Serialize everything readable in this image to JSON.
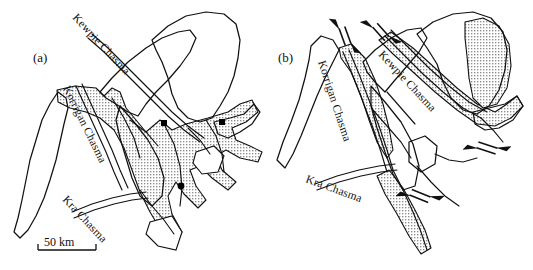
{
  "figure": {
    "type": "geologic-sketch-map",
    "panel_count": 2,
    "background_color": "#ffffff",
    "line_color": "#111111",
    "stipple_color": "#8a8a8a",
    "marker_color": "#000000"
  },
  "panels": [
    {
      "id": "a",
      "tag": "(a)",
      "tag_x": 33,
      "tag_y": 62,
      "labels": [
        {
          "name": "kewpie-chasma-label",
          "text": "Kewpie Chasma",
          "x": 72,
          "y": 18,
          "rotate": 47
        },
        {
          "name": "korrigan-chasma-label",
          "text": "Korrigan Chasma",
          "x": 63,
          "y": 88,
          "rotate": 64
        },
        {
          "name": "kra-chasma-label",
          "text": "Kra Chasma",
          "x": 62,
          "y": 200,
          "rotate": 47
        }
      ],
      "markers": [
        {
          "name": "site-marker-1",
          "x": 164,
          "y": 123,
          "size": 5.5
        },
        {
          "name": "site-marker-2",
          "x": 222,
          "y": 122,
          "size": 5.5
        },
        {
          "name": "site-marker-3",
          "x": 181,
          "y": 185,
          "size": 5.5
        },
        {
          "name": "site-marker-4",
          "x": 182,
          "y": 186,
          "size": 5.5
        }
      ],
      "scale_bar": {
        "name": "scale-bar",
        "label": "50 km",
        "x": 38,
        "y": 238,
        "length": 58
      }
    },
    {
      "id": "b",
      "tag": "(b)",
      "tag_x": 278,
      "tag_y": 62,
      "labels": [
        {
          "name": "korrigan-chasma-label",
          "text": "Korrigan Chasma",
          "x": 318,
          "y": 62,
          "rotate": 72
        },
        {
          "name": "kewpie-chasma-label",
          "text": "Kewpie Chasma",
          "x": 378,
          "y": 55,
          "rotate": 47
        },
        {
          "name": "kra-chasma-label",
          "text": "Kra Chasma",
          "x": 322,
          "y": 168,
          "rotate": 0
        }
      ],
      "shear_symbols": [
        {
          "name": "strike-slip-arrow-korrigan",
          "x": 345,
          "y": 38,
          "rotate": 70
        },
        {
          "name": "strike-slip-arrow-kewpie",
          "x": 381,
          "y": 32,
          "rotate": 48
        },
        {
          "name": "strike-slip-arrow-east",
          "x": 487,
          "y": 148,
          "rotate": 18
        },
        {
          "name": "strike-slip-arrow-south",
          "x": 420,
          "y": 196,
          "rotate": 22
        }
      ]
    }
  ]
}
